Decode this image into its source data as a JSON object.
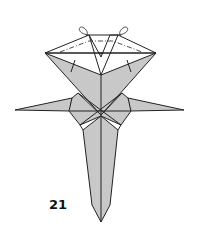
{
  "diagram": {
    "type": "origami-step",
    "step_number": "21",
    "colors": {
      "paper_back": "#c8c8c8",
      "paper_front": "#ffffff",
      "line": "#222222"
    },
    "elements": [
      "top-flaps-with-fold-arrows",
      "left-arm",
      "right-arm",
      "center-body",
      "tail-point"
    ]
  }
}
